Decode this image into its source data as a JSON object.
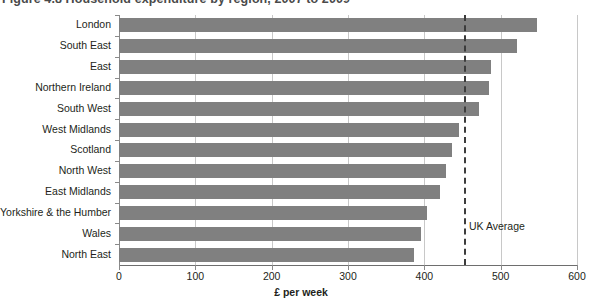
{
  "figure": {
    "title": "Figure 4.8  Household expenditure by region, 2007 to 2009",
    "bar_color": "#808080",
    "grid_color": "#c8c8c8",
    "axis_color": "#8a8a8a",
    "average_line_color": "#3c3c3c"
  },
  "chart_data": {
    "type": "bar",
    "orientation": "horizontal",
    "title": "Figure 4.8  Household expenditure by region, 2007 to 2009",
    "xlabel": "£ per week",
    "ylabel": "",
    "xlim": [
      0,
      600
    ],
    "xticks": [
      0,
      100,
      200,
      300,
      400,
      500,
      600
    ],
    "xticklabels": [
      "0",
      "100",
      "200",
      "300",
      "400",
      "500",
      "600"
    ],
    "grid": true,
    "legend": null,
    "categories": [
      "London",
      "South East",
      "East",
      "Northern Ireland",
      "South West",
      "West Midlands",
      "Scotland",
      "North West",
      "East Midlands",
      "Yorkshire & the Humber",
      "Wales",
      "North East"
    ],
    "values": [
      548,
      522,
      487,
      485,
      472,
      445,
      436,
      429,
      421,
      403,
      396,
      386
    ],
    "annotations": [
      {
        "name": "uk-average",
        "label": "UK Average",
        "value": 452,
        "style": "dashed vertical line"
      }
    ]
  }
}
